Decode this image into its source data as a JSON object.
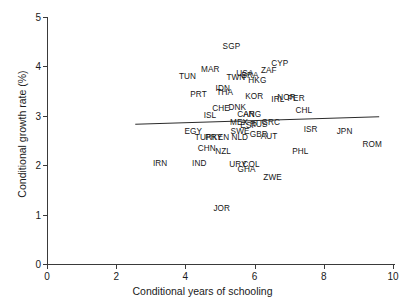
{
  "chart_data": {
    "type": "scatter",
    "title": "",
    "xlabel": "Conditional years of schooling",
    "ylabel": "Conditional growth rate (%)",
    "xlim": [
      0,
      10
    ],
    "ylim": [
      0,
      5
    ],
    "xticks": [
      0,
      2,
      4,
      6,
      8,
      10
    ],
    "yticks": [
      0,
      1,
      2,
      3,
      4,
      5
    ],
    "grid": false,
    "legend": "none",
    "marker_style": "text-label-only",
    "fit_line": {
      "name": "regression line",
      "x_start": 2.55,
      "y_start": 2.83,
      "x_end": 9.6,
      "y_end": 2.98
    },
    "points": [
      {
        "label": "SGP",
        "x": 5.33,
        "y": 4.41
      },
      {
        "label": "CYP",
        "x": 6.73,
        "y": 4.07
      },
      {
        "label": "MAR",
        "x": 4.72,
        "y": 3.95
      },
      {
        "label": "ZAF",
        "x": 6.41,
        "y": 3.92
      },
      {
        "label": "USA",
        "x": 5.72,
        "y": 3.86
      },
      {
        "label": "TUN",
        "x": 4.06,
        "y": 3.8
      },
      {
        "label": "BRA",
        "x": 5.87,
        "y": 3.83
      },
      {
        "label": "TWN",
        "x": 5.46,
        "y": 3.79
      },
      {
        "label": "HKG",
        "x": 6.08,
        "y": 3.72
      },
      {
        "label": "IDN",
        "x": 5.08,
        "y": 3.57
      },
      {
        "label": "THA",
        "x": 5.14,
        "y": 3.49
      },
      {
        "label": "PRT",
        "x": 4.38,
        "y": 3.45
      },
      {
        "label": "KOR",
        "x": 5.99,
        "y": 3.4
      },
      {
        "label": "PER",
        "x": 7.2,
        "y": 3.36
      },
      {
        "label": "NOR",
        "x": 6.92,
        "y": 3.39
      },
      {
        "label": "IRL",
        "x": 6.67,
        "y": 3.35
      },
      {
        "label": "DNK",
        "x": 5.5,
        "y": 3.18
      },
      {
        "label": "CHE",
        "x": 5.03,
        "y": 3.15
      },
      {
        "label": "CHL",
        "x": 7.42,
        "y": 3.12
      },
      {
        "label": "ISL",
        "x": 4.71,
        "y": 3.01
      },
      {
        "label": "CAN",
        "x": 5.75,
        "y": 3.03
      },
      {
        "label": "ARG",
        "x": 5.93,
        "y": 3.03
      },
      {
        "label": "GRC",
        "x": 6.47,
        "y": 2.88
      },
      {
        "label": "MEX",
        "x": 5.55,
        "y": 2.87
      },
      {
        "label": "ESP",
        "x": 5.83,
        "y": 2.82
      },
      {
        "label": "RUS",
        "x": 6.12,
        "y": 2.83
      },
      {
        "label": "ISR",
        "x": 7.62,
        "y": 2.73
      },
      {
        "label": "EGY",
        "x": 4.23,
        "y": 2.7
      },
      {
        "label": "SWE",
        "x": 5.58,
        "y": 2.7
      },
      {
        "label": "GBR",
        "x": 6.12,
        "y": 2.64
      },
      {
        "label": "JPN",
        "x": 8.6,
        "y": 2.69
      },
      {
        "label": "AUT",
        "x": 6.42,
        "y": 2.59
      },
      {
        "label": "NLD",
        "x": 5.57,
        "y": 2.58
      },
      {
        "label": "TUR",
        "x": 4.52,
        "y": 2.58
      },
      {
        "label": "PRY",
        "x": 4.82,
        "y": 2.57
      },
      {
        "label": "KEN",
        "x": 5.02,
        "y": 2.57
      },
      {
        "label": "ROM",
        "x": 9.4,
        "y": 2.42
      },
      {
        "label": "CHN",
        "x": 4.62,
        "y": 2.35
      },
      {
        "label": "NZL",
        "x": 5.09,
        "y": 2.29
      },
      {
        "label": "PHL",
        "x": 7.32,
        "y": 2.28
      },
      {
        "label": "IND",
        "x": 4.4,
        "y": 2.05
      },
      {
        "label": "IRN",
        "x": 3.27,
        "y": 2.04
      },
      {
        "label": "URY",
        "x": 5.52,
        "y": 2.02
      },
      {
        "label": "COL",
        "x": 5.9,
        "y": 2.03
      },
      {
        "label": "GHA",
        "x": 5.77,
        "y": 1.92
      },
      {
        "label": "ZWE",
        "x": 6.52,
        "y": 1.76
      },
      {
        "label": "JOR",
        "x": 5.05,
        "y": 1.13
      }
    ]
  },
  "figure": {
    "name": "conditional-growth-scatter",
    "background": "#ffffff",
    "axis_color": "#3a3a3a",
    "label_color": "#151515"
  }
}
